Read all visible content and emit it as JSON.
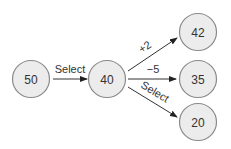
{
  "diagram": {
    "nodes": [
      {
        "id": "n50",
        "label": "50"
      },
      {
        "id": "n40",
        "label": "40"
      },
      {
        "id": "n42",
        "label": "42"
      },
      {
        "id": "n35",
        "label": "35"
      },
      {
        "id": "n20",
        "label": "20"
      }
    ],
    "edges": [
      {
        "from": "n50",
        "to": "n40",
        "label": "Select"
      },
      {
        "from": "n40",
        "to": "n42",
        "label": "+2"
      },
      {
        "from": "n40",
        "to": "n35",
        "label": "−5"
      },
      {
        "from": "n40",
        "to": "n20",
        "label": "Select"
      }
    ]
  }
}
